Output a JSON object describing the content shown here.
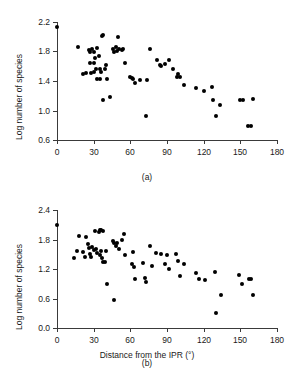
{
  "figure": {
    "xlabel": "Distance from the IPR (°)",
    "ylabel": "Log number of species",
    "panel_a_tag": "(a)",
    "panel_b_tag": "(b)",
    "marker_color": "#000000",
    "axis_color": "#3a3a3a"
  },
  "chart_data": [
    {
      "type": "scatter",
      "panel": "(a)",
      "title": "",
      "xlabel": "",
      "ylabel": "Log number of species",
      "xlim": [
        0,
        180
      ],
      "ylim": [
        0.6,
        2.2
      ],
      "xticks": [
        0,
        30,
        60,
        90,
        120,
        150,
        180
      ],
      "xticklabels": [
        "0",
        "30",
        "60",
        "90",
        "120",
        "150",
        "180"
      ],
      "yticks": [
        0.6,
        1.0,
        1.4,
        1.8,
        2.2
      ],
      "yticklabels": [
        "0.6",
        "1.0",
        "1.4",
        "1.8",
        "2.2"
      ],
      "grid": false,
      "legend": null,
      "points": [
        [
          0,
          2.13
        ],
        [
          17,
          1.86
        ],
        [
          21,
          1.5
        ],
        [
          24,
          1.51
        ],
        [
          26,
          1.82
        ],
        [
          27,
          1.8
        ],
        [
          27,
          1.64
        ],
        [
          28,
          1.51
        ],
        [
          29,
          1.84
        ],
        [
          30,
          1.79
        ],
        [
          30,
          1.65
        ],
        [
          30,
          1.52
        ],
        [
          31,
          1.71
        ],
        [
          32,
          1.56
        ],
        [
          33,
          1.85
        ],
        [
          33,
          1.43
        ],
        [
          34,
          1.74
        ],
        [
          35,
          1.57
        ],
        [
          35,
          1.43
        ],
        [
          36,
          1.52
        ],
        [
          37,
          2.01
        ],
        [
          38,
          2.03
        ],
        [
          38,
          1.14
        ],
        [
          39,
          1.56
        ],
        [
          40,
          1.62
        ],
        [
          41,
          1.43
        ],
        [
          43,
          1.18
        ],
        [
          46,
          1.83
        ],
        [
          47,
          1.8
        ],
        [
          48,
          1.86
        ],
        [
          49,
          1.81
        ],
        [
          50,
          2.0
        ],
        [
          51,
          1.84
        ],
        [
          53,
          1.82
        ],
        [
          54,
          1.83
        ],
        [
          56,
          1.64
        ],
        [
          60,
          1.45
        ],
        [
          61,
          1.44
        ],
        [
          62,
          1.43
        ],
        [
          64,
          1.37
        ],
        [
          68,
          1.41
        ],
        [
          73,
          0.92
        ],
        [
          74,
          1.42
        ],
        [
          76,
          1.84
        ],
        [
          82,
          1.68
        ],
        [
          84,
          1.62
        ],
        [
          85,
          1.61
        ],
        [
          88,
          1.63
        ],
        [
          92,
          1.68
        ],
        [
          95,
          1.57
        ],
        [
          98,
          1.46
        ],
        [
          99,
          1.5
        ],
        [
          101,
          1.45
        ],
        [
          104,
          1.34
        ],
        [
          114,
          1.3
        ],
        [
          120,
          1.26
        ],
        [
          127,
          1.32
        ],
        [
          128,
          1.14
        ],
        [
          130,
          0.92
        ],
        [
          133,
          1.08
        ],
        [
          150,
          1.14
        ],
        [
          152,
          1.14
        ],
        [
          156,
          0.79
        ],
        [
          159,
          0.79
        ],
        [
          160,
          1.15
        ]
      ]
    },
    {
      "type": "scatter",
      "panel": "(b)",
      "title": "",
      "xlabel": "Distance from the IPR (°)",
      "ylabel": "Log number of species",
      "xlim": [
        0,
        180
      ],
      "ylim": [
        0.0,
        2.4
      ],
      "xticks": [
        0,
        30,
        60,
        90,
        120,
        150,
        180
      ],
      "xticklabels": [
        "0",
        "30",
        "60",
        "90",
        "120",
        "150",
        "180"
      ],
      "yticks": [
        0.0,
        0.6,
        1.2,
        1.8,
        2.4
      ],
      "yticklabels": [
        "0.0",
        "0.6",
        "1.2",
        "1.8",
        "2.4"
      ],
      "grid": false,
      "legend": null,
      "points": [
        [
          0,
          2.1
        ],
        [
          14,
          1.42
        ],
        [
          16,
          1.57
        ],
        [
          18,
          1.87
        ],
        [
          21,
          1.55
        ],
        [
          23,
          1.44
        ],
        [
          24,
          1.86
        ],
        [
          25,
          1.7
        ],
        [
          26,
          1.62
        ],
        [
          27,
          1.51
        ],
        [
          28,
          1.45
        ],
        [
          29,
          1.65
        ],
        [
          30,
          1.58
        ],
        [
          31,
          1.97
        ],
        [
          32,
          1.6
        ],
        [
          33,
          1.52
        ],
        [
          34,
          1.95
        ],
        [
          35,
          2.0
        ],
        [
          35,
          1.49
        ],
        [
          36,
          1.99
        ],
        [
          36,
          1.56
        ],
        [
          37,
          1.43
        ],
        [
          38,
          1.97
        ],
        [
          38,
          1.35
        ],
        [
          39,
          1.34
        ],
        [
          40,
          1.57
        ],
        [
          41,
          0.9
        ],
        [
          46,
          1.78
        ],
        [
          47,
          1.72
        ],
        [
          47,
          0.58
        ],
        [
          48,
          1.66
        ],
        [
          49,
          1.73
        ],
        [
          51,
          1.6
        ],
        [
          53,
          1.8
        ],
        [
          55,
          1.92
        ],
        [
          56,
          1.48
        ],
        [
          61,
          1.3
        ],
        [
          62,
          1.54
        ],
        [
          63,
          1.25
        ],
        [
          64,
          0.99
        ],
        [
          70,
          1.32
        ],
        [
          72,
          1.02
        ],
        [
          73,
          0.94
        ],
        [
          76,
          1.66
        ],
        [
          78,
          1.26
        ],
        [
          81,
          1.53
        ],
        [
          85,
          1.5
        ],
        [
          88,
          1.3
        ],
        [
          90,
          1.49
        ],
        [
          92,
          1.2
        ],
        [
          97,
          1.5
        ],
        [
          99,
          1.36
        ],
        [
          101,
          1.06
        ],
        [
          104,
          1.3
        ],
        [
          114,
          1.12
        ],
        [
          116,
          1.0
        ],
        [
          121,
          0.98
        ],
        [
          129,
          1.13
        ],
        [
          130,
          0.3
        ],
        [
          134,
          0.68
        ],
        [
          149,
          1.08
        ],
        [
          151,
          0.9
        ],
        [
          157,
          0.99
        ],
        [
          159,
          1.0
        ],
        [
          160,
          0.68
        ]
      ]
    }
  ]
}
